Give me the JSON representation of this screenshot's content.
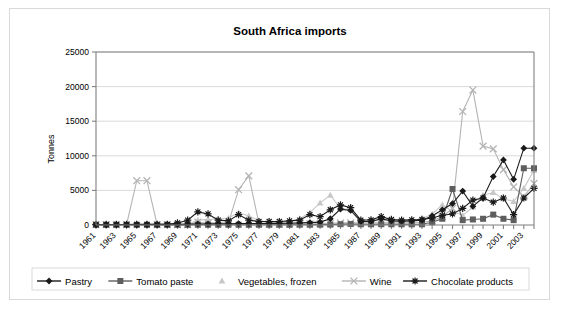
{
  "chart_data": {
    "type": "line",
    "title": "South Africa imports",
    "xlabel": "",
    "ylabel": "Tonnes",
    "ylim": [
      0,
      25000
    ],
    "ytick_values": [
      0,
      5000,
      10000,
      15000,
      20000,
      25000
    ],
    "ytick_labels": [
      "0",
      "5000",
      "10000",
      "15000",
      "20000",
      "25000"
    ],
    "grid": true,
    "legend_position": "bottom",
    "x": [
      1961,
      1962,
      1963,
      1964,
      1965,
      1966,
      1967,
      1968,
      1969,
      1970,
      1971,
      1972,
      1973,
      1974,
      1975,
      1976,
      1977,
      1978,
      1979,
      1980,
      1981,
      1982,
      1983,
      1984,
      1985,
      1986,
      1987,
      1988,
      1989,
      1990,
      1991,
      1992,
      1993,
      1994,
      1995,
      1996,
      1997,
      1998,
      1999,
      2000,
      2001,
      2002,
      2003,
      2004
    ],
    "xtick_labels": [
      "1961",
      "1963",
      "1965",
      "1967",
      "1969",
      "1971",
      "1973",
      "1975",
      "1977",
      "1979",
      "1981",
      "1983",
      "1985",
      "1987",
      "1989",
      "1991",
      "1993",
      "1995",
      "1997",
      "1999",
      "2001",
      "2003"
    ],
    "series": [
      {
        "name": "Pastry",
        "marker": "diamond",
        "color": "#1a1a1a",
        "values": [
          60,
          60,
          70,
          70,
          80,
          80,
          90,
          100,
          110,
          120,
          150,
          160,
          170,
          180,
          200,
          210,
          220,
          230,
          240,
          250,
          300,
          350,
          420,
          900,
          2300,
          2100,
          500,
          520,
          900,
          600,
          550,
          600,
          700,
          1300,
          2200,
          3100,
          4900,
          2700,
          3900,
          7000,
          9400,
          6600,
          11100,
          11100
        ]
      },
      {
        "name": "Tomato paste",
        "marker": "square",
        "color": "#5e5e5e",
        "values": [
          20,
          20,
          20,
          20,
          20,
          20,
          20,
          20,
          20,
          20,
          30,
          30,
          30,
          30,
          30,
          30,
          30,
          30,
          30,
          30,
          40,
          40,
          50,
          60,
          120,
          150,
          100,
          100,
          110,
          100,
          100,
          100,
          100,
          400,
          900,
          5200,
          700,
          800,
          900,
          1500,
          900,
          700,
          8200,
          8200
        ]
      },
      {
        "name": "Vegetables, frozen",
        "marker": "triangle",
        "color": "#c8c8c8",
        "values": [
          30,
          30,
          30,
          30,
          30,
          30,
          30,
          40,
          40,
          50,
          700,
          800,
          900,
          1000,
          1800,
          1300,
          600,
          400,
          400,
          500,
          900,
          1800,
          3200,
          4300,
          2400,
          2200,
          600,
          500,
          700,
          600,
          500,
          600,
          900,
          1600,
          2900,
          2000,
          1400,
          2600,
          4300,
          4700,
          3800,
          3400,
          5300,
          7900
        ]
      },
      {
        "name": "Wine",
        "marker": "cross",
        "color": "#b4b4b4",
        "values": [
          60,
          60,
          60,
          60,
          6400,
          6400,
          60,
          60,
          60,
          60,
          400,
          300,
          300,
          300,
          5100,
          7100,
          200,
          150,
          150,
          150,
          150,
          150,
          200,
          250,
          300,
          300,
          300,
          300,
          300,
          300,
          300,
          300,
          400,
          600,
          1200,
          2400,
          16400,
          19500,
          11400,
          11000,
          8000,
          5500,
          4100,
          6000
        ]
      },
      {
        "name": "Chocolate products",
        "marker": "asterisk",
        "color": "#1a1a1a",
        "values": [
          80,
          80,
          80,
          80,
          90,
          90,
          90,
          100,
          300,
          700,
          1900,
          1600,
          700,
          600,
          1500,
          700,
          500,
          500,
          500,
          600,
          700,
          1500,
          1200,
          2200,
          2900,
          2500,
          700,
          750,
          1200,
          800,
          700,
          750,
          800,
          1000,
          1400,
          1600,
          2400,
          3600,
          3900,
          3300,
          3900,
          1500,
          3900,
          5300
        ]
      }
    ]
  },
  "legend": {
    "items": [
      {
        "label": "Pastry"
      },
      {
        "label": "Tomato paste"
      },
      {
        "label": "Vegetables, frozen"
      },
      {
        "label": "Wine"
      },
      {
        "label": "Chocolate products"
      }
    ]
  }
}
